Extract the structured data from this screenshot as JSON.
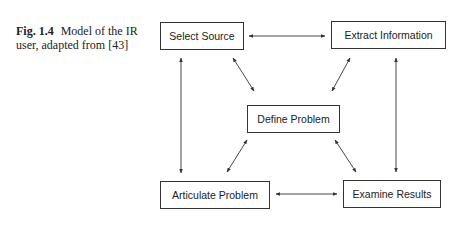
{
  "caption": {
    "label": "Fig. 1.4",
    "text": "Model of the IR user, adapted from [43]"
  },
  "nodes": {
    "select_source": "Select Source",
    "extract_information": "Extract Information",
    "define_problem": "Define Problem",
    "articulate_problem": "Articulate Problem",
    "examine_results": "Examine Results"
  },
  "edges": [
    {
      "from": "Select Source",
      "to": "Extract Information",
      "direction": "both"
    },
    {
      "from": "Select Source",
      "to": "Articulate Problem",
      "direction": "both"
    },
    {
      "from": "Extract Information",
      "to": "Examine Results",
      "direction": "both"
    },
    {
      "from": "Select Source",
      "to": "Define Problem",
      "direction": "both"
    },
    {
      "from": "Extract Information",
      "to": "Define Problem",
      "direction": "both"
    },
    {
      "from": "Define Problem",
      "to": "Articulate Problem",
      "direction": "both"
    },
    {
      "from": "Define Problem",
      "to": "Examine Results",
      "direction": "both"
    },
    {
      "from": "Articulate Problem",
      "to": "Examine Results",
      "direction": "both"
    }
  ]
}
